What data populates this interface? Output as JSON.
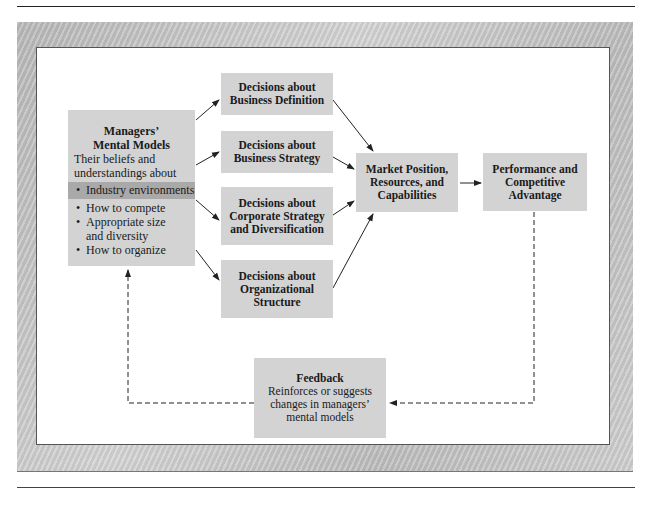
{
  "diagram": {
    "managers_box": {
      "title_line1": "Managers’",
      "title_line2": "Mental Models",
      "desc_line1": "Their beliefs and",
      "desc_line2": "understandings about",
      "bullets": [
        {
          "text": "Industry environments",
          "highlighted": true
        },
        {
          "text": "How to compete",
          "highlighted": false
        },
        {
          "text": "Appropriate size",
          "highlighted": false
        },
        {
          "text": "and diversity",
          "continuation": true
        },
        {
          "text": "How to organize",
          "highlighted": false
        }
      ]
    },
    "decisions": [
      {
        "line1": "Decisions about",
        "line2": "Business Definition"
      },
      {
        "line1": "Decisions about",
        "line2": "Business Strategy"
      },
      {
        "line1": "Decisions about",
        "line2": "Corporate Strategy",
        "line3": "and Diversification"
      },
      {
        "line1": "Decisions about",
        "line2": "Organizational",
        "line3": "Structure"
      }
    ],
    "market_box": {
      "line1": "Market Position,",
      "line2": "Resources, and",
      "line3": "Capabilities"
    },
    "performance_box": {
      "line1": "Performance and",
      "line2": "Competitive",
      "line3": "Advantage"
    },
    "feedback_box": {
      "title": "Feedback",
      "line1": "Reinforces or suggests",
      "line2": "changes in managers’",
      "line3": "mental models"
    },
    "colors": {
      "box_fill": "#d3d3d3",
      "highlight": "#a9a9a9",
      "frame": "#c4c4c4"
    }
  }
}
